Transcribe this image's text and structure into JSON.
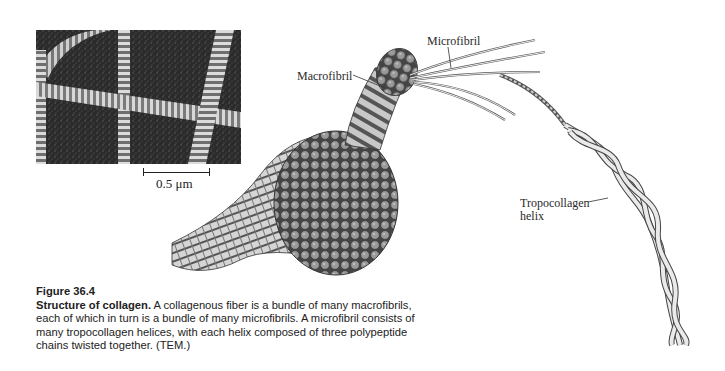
{
  "micrograph": {
    "scale_label": "0.5 μm"
  },
  "labels": {
    "microfibril": "Microfibril",
    "macrofibril": "Macrofibril",
    "tropocollagen_line1": "Tropocollagen",
    "tropocollagen_line2": "helix"
  },
  "caption": {
    "figure_number": "Figure 36.4",
    "title": "Structure of collagen.",
    "body": " A collagenous fiber is a bundle of many macrofibrils, each of which in turn is a bundle of many microfibrils. A microfibril consists of many tropocollagen helices, with each helix composed of three polypeptide chains twisted together. (TEM.)"
  },
  "colors": {
    "text": "#222222",
    "micrograph_bg": "#2a2a2a",
    "fiber_light": "#e8e8e8",
    "fiber_dark": "#555555"
  }
}
